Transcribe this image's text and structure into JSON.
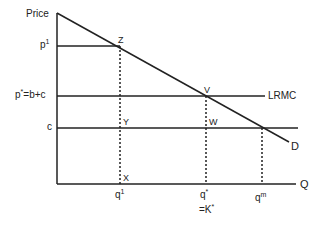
{
  "diagram": {
    "y_axis_label": "Price",
    "x_axis_label": "Q",
    "price_labels": {
      "p1_base": "p",
      "p1_sup": "1",
      "pstar_base": "p",
      "pstar_sup": "*",
      "pstar_rest": "=b+c",
      "c": "c"
    },
    "quantity_labels": {
      "q1_base": "q",
      "q1_sup": "1",
      "qstar_base": "q",
      "qstar_sup": "*",
      "kstar_base": "=K",
      "kstar_sup": "*",
      "qm_base": "q",
      "qm_sup": "m"
    },
    "curve_labels": {
      "lrmc": "LRMC",
      "demand": "D"
    },
    "points": {
      "z": "Z",
      "v": "V",
      "y": "Y",
      "w": "W",
      "x": "X"
    },
    "colors": {
      "line": "#222222",
      "background": "#ffffff"
    }
  }
}
